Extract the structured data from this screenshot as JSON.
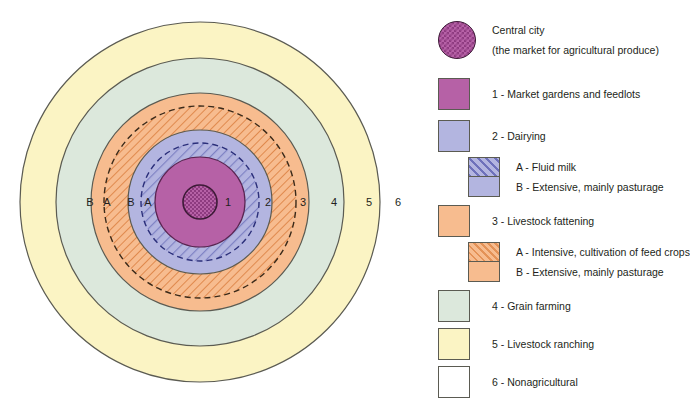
{
  "diagram": {
    "name": "von-thunen-model",
    "center": {
      "x": 200,
      "y": 202
    },
    "ring_labels": [
      {
        "text": "1",
        "x": 228,
        "y": 206
      },
      {
        "text": "2",
        "x": 268,
        "y": 206
      },
      {
        "text": "3",
        "x": 303,
        "y": 206
      },
      {
        "text": "4",
        "x": 334,
        "y": 206
      },
      {
        "text": "5",
        "x": 369,
        "y": 206
      },
      {
        "text": "6",
        "x": 398,
        "y": 206
      },
      {
        "text": "B",
        "x": 90,
        "y": 206
      },
      {
        "text": "A",
        "x": 107,
        "y": 206
      },
      {
        "text": "B",
        "x": 131,
        "y": 206
      },
      {
        "text": "A",
        "x": 148,
        "y": 206
      }
    ],
    "zones": [
      {
        "id": "6",
        "name": "nonagricultural",
        "radius": 200,
        "color": "#ffffff"
      },
      {
        "id": "5",
        "name": "livestock-ranching",
        "radius": 180,
        "color": "#fbf4c4"
      },
      {
        "id": "4",
        "name": "grain-farming",
        "radius": 144,
        "color": "#dce8dc"
      },
      {
        "id": "3B",
        "name": "livestock-fattening-extensive",
        "radius": 108,
        "color": "#f7bc8f"
      },
      {
        "id": "3A",
        "name": "livestock-fattening-intensive",
        "radius": 95,
        "color": "#f7bc8f"
      },
      {
        "id": "2B",
        "name": "dairying-extensive",
        "radius": 72,
        "color": "#b3b5e0"
      },
      {
        "id": "2A",
        "name": "dairying-fluid-milk",
        "radius": 58,
        "color": "#b3b5e0"
      },
      {
        "id": "1",
        "name": "market-gardens-feedlots",
        "radius": 45,
        "color": "#b661a6"
      },
      {
        "id": "city",
        "name": "central-city",
        "radius": 17,
        "color": "#b661a6"
      }
    ]
  },
  "legend": {
    "title": "",
    "items": [
      {
        "key": "central-city",
        "swatch": "circle-hatched-purple",
        "color": "#b661a6",
        "lines": [
          "Central city",
          "(the market for agricultural produce)"
        ]
      },
      {
        "key": "zone-1",
        "swatch": "square-purple",
        "color": "#b661a6",
        "lines": [
          "1 - Market gardens and feedlots"
        ]
      },
      {
        "key": "zone-2",
        "swatch": "square-blue",
        "color": "#b3b5e0",
        "lines": [
          "2 - Dairying"
        ]
      },
      {
        "key": "zone-2-sub",
        "swatch": "split-blue-hatched",
        "color": "#b3b5e0",
        "lines": [
          "A - Fluid milk",
          "B - Extensive, mainly pasturage"
        ]
      },
      {
        "key": "zone-3",
        "swatch": "square-orange",
        "color": "#f7bc8f",
        "lines": [
          "3 - Livestock fattening"
        ]
      },
      {
        "key": "zone-3-sub",
        "swatch": "split-orange-hatched",
        "color": "#f7bc8f",
        "lines": [
          "A - Intensive, cultivation of feed crops",
          "B - Extensive, mainly pasturage"
        ]
      },
      {
        "key": "zone-4",
        "swatch": "square-green",
        "color": "#dce8dc",
        "lines": [
          "4 - Grain farming"
        ]
      },
      {
        "key": "zone-5",
        "swatch": "square-yellow",
        "color": "#fbf4c4",
        "lines": [
          "5 - Livestock ranching"
        ]
      },
      {
        "key": "zone-6",
        "swatch": "square-white",
        "color": "#ffffff",
        "lines": [
          "6 - Nonagricultural"
        ]
      }
    ]
  },
  "colors": {
    "purple": "#b661a6",
    "blue": "#b3b5e0",
    "orange": "#f7bc8f",
    "green": "#dce8dc",
    "yellow": "#fbf4c4",
    "white": "#ffffff",
    "outline": "#5b5b52",
    "dash": "#2b2f7a",
    "text": "#231f20"
  }
}
